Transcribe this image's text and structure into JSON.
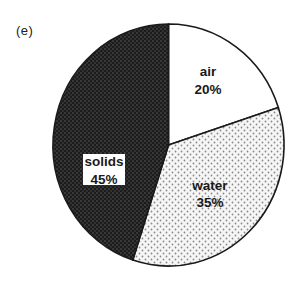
{
  "panel_label": "(e)",
  "chart_data": {
    "type": "pie",
    "title": "",
    "panel": "(e)",
    "categories": [
      "air",
      "water",
      "solids"
    ],
    "values": [
      20,
      35,
      45
    ],
    "unit": "%",
    "start_angle_deg": 0,
    "direction": "clockwise from 12 o'clock",
    "legend": "none (labels inside slices)",
    "slices": [
      {
        "name": "air",
        "value": 20,
        "label": "air",
        "pct_label": "20%",
        "fill": "white"
      },
      {
        "name": "water",
        "value": 35,
        "label": "water",
        "pct_label": "35%",
        "fill": "light stipple"
      },
      {
        "name": "solids",
        "value": 45,
        "label": "solids",
        "pct_label": "45%",
        "fill": "dark stipple"
      }
    ]
  },
  "colors": {
    "outline": "#1a1a1a",
    "air": "#ffffff",
    "water_bg": "#f4f4f4",
    "water_dot": "#8a8a8a",
    "solids_bg": "#1c1c1c",
    "solids_dot": "#6a6a6a"
  }
}
